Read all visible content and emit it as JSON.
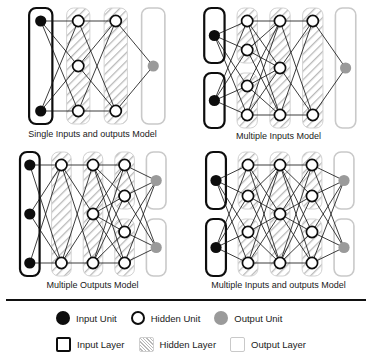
{
  "figure": {
    "divider_color": "#111111"
  },
  "colors": {
    "input_unit": "#0d0d0d",
    "hidden_unit_fill": "#ffffff",
    "hidden_unit_stroke": "#0d0d0d",
    "output_unit": "#9a9a9a",
    "input_layer_border": "#0d0d0d",
    "hidden_layer_hatch": "#b9b9b9",
    "output_layer_border": "#c9c9c9",
    "edge": "#1a1a1a",
    "background": "#ffffff"
  },
  "panels": [
    {
      "id": "single-inputs-and-outputs",
      "caption": "Single Inputs and outputs Model",
      "layers": [
        {
          "type": "input",
          "boxes": [
            {
              "units": 2
            }
          ]
        },
        {
          "type": "hidden",
          "boxes": [
            {
              "units": 3
            }
          ]
        },
        {
          "type": "hidden",
          "boxes": [
            {
              "units": 2
            }
          ]
        },
        {
          "type": "output",
          "boxes": [
            {
              "units": 1
            }
          ]
        }
      ]
    },
    {
      "id": "multiple-inputs",
      "caption": "Multiple Inputs Model",
      "layers": [
        {
          "type": "input",
          "boxes": [
            {
              "units": 1
            },
            {
              "units": 1
            }
          ]
        },
        {
          "type": "hidden",
          "boxes": [
            {
              "units": 2
            },
            {
              "units": 2
            }
          ]
        },
        {
          "type": "hidden",
          "boxes": [
            {
              "units": 3
            }
          ]
        },
        {
          "type": "hidden",
          "boxes": [
            {
              "units": 2
            }
          ]
        },
        {
          "type": "output",
          "boxes": [
            {
              "units": 1
            }
          ]
        }
      ]
    },
    {
      "id": "multiple-outputs",
      "caption": "Multiple Outputs Model",
      "layers": [
        {
          "type": "input",
          "boxes": [
            {
              "units": 3
            }
          ]
        },
        {
          "type": "hidden",
          "boxes": [
            {
              "units": 2
            }
          ]
        },
        {
          "type": "hidden",
          "boxes": [
            {
              "units": 3
            }
          ]
        },
        {
          "type": "hidden",
          "boxes": [
            {
              "units": 2
            },
            {
              "units": 2
            }
          ]
        },
        {
          "type": "output",
          "boxes": [
            {
              "units": 1
            },
            {
              "units": 1
            }
          ]
        }
      ]
    },
    {
      "id": "multiple-inputs-and-outputs",
      "caption": "Multiple Inputs and outputs Model",
      "layers": [
        {
          "type": "input",
          "boxes": [
            {
              "units": 1
            },
            {
              "units": 1
            }
          ]
        },
        {
          "type": "hidden",
          "boxes": [
            {
              "units": 2
            },
            {
              "units": 2
            }
          ]
        },
        {
          "type": "hidden",
          "boxes": [
            {
              "units": 3
            }
          ]
        },
        {
          "type": "hidden",
          "boxes": [
            {
              "units": 2
            },
            {
              "units": 2
            }
          ]
        },
        {
          "type": "output",
          "boxes": [
            {
              "units": 1
            },
            {
              "units": 1
            }
          ]
        }
      ]
    }
  ],
  "legend": {
    "units_row": [
      {
        "key": "input-unit",
        "label": "Input Unit"
      },
      {
        "key": "hidden-unit",
        "label": "Hidden Unit"
      },
      {
        "key": "output-unit",
        "label": "Output Unit"
      }
    ],
    "layers_row": [
      {
        "key": "input-layer",
        "label": "Input Layer"
      },
      {
        "key": "hidden-layer",
        "label": "Hidden Layer"
      },
      {
        "key": "output-layer",
        "label": "Output Layer"
      }
    ]
  }
}
